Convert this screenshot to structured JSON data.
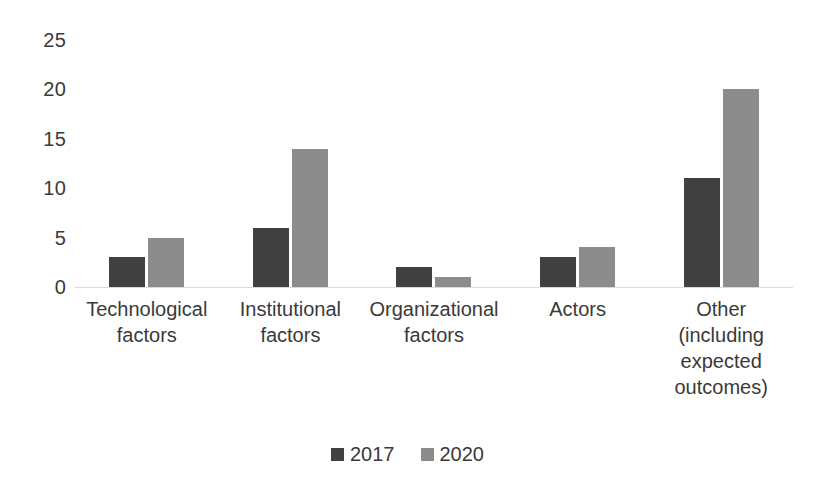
{
  "chart_data": {
    "type": "bar",
    "title": "",
    "xlabel": "",
    "ylabel": "",
    "ylim": [
      0,
      25
    ],
    "ytick_values": [
      25,
      20,
      15,
      10,
      5,
      0
    ],
    "ytick_labels": [
      "25",
      "20",
      "15",
      "10",
      "5",
      "0"
    ],
    "grid": false,
    "legend_position": "bottom",
    "categories": [
      "Technological\nfactors",
      "Institutional\nfactors",
      "Organizational\nfactors",
      "Actors",
      "Other\n(including\nexpected\noutcomes)"
    ],
    "series": [
      {
        "name": "2017",
        "color": "#404040",
        "values": [
          3,
          6,
          2,
          3,
          11
        ]
      },
      {
        "name": "2020",
        "color": "#8c8c8c",
        "values": [
          5,
          14,
          1,
          4,
          20
        ]
      }
    ]
  },
  "legend": {
    "items": [
      {
        "label": "2017",
        "color": "#404040"
      },
      {
        "label": "2020",
        "color": "#8c8c8c"
      }
    ]
  }
}
